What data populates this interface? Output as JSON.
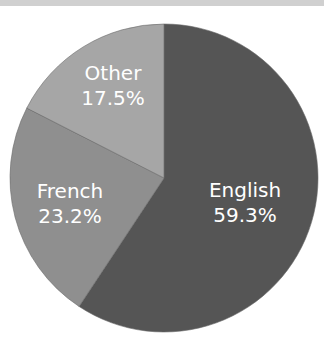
{
  "chart_data": {
    "type": "pie",
    "title": "",
    "start_angle": "12 o'clock, clockwise",
    "slices": [
      {
        "label": "English",
        "value": 59.3,
        "value_label": "59.3%",
        "color": "#555555"
      },
      {
        "label": "French",
        "value": 23.2,
        "value_label": "23.2%",
        "color": "#8f8f8f"
      },
      {
        "label": "Other",
        "value": 17.5,
        "value_label": "17.5%",
        "color": "#a6a6a6"
      }
    ],
    "legend": "none (labels inside slices)"
  }
}
